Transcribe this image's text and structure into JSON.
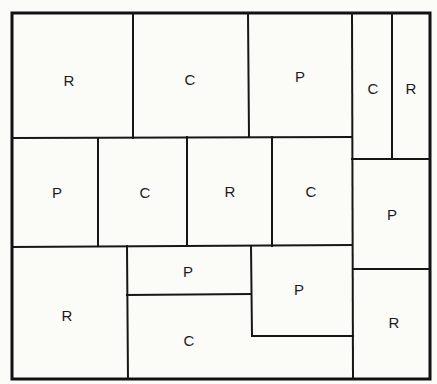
{
  "diagram": {
    "type": "floor-plan-partition",
    "legend_codes": [
      "R",
      "C",
      "P"
    ],
    "regions": [
      {
        "id": "r1",
        "label": "R",
        "row": 1,
        "position": "top-left"
      },
      {
        "id": "r2",
        "label": "C",
        "row": 1,
        "position": "top-center-left"
      },
      {
        "id": "r3",
        "label": "P",
        "row": 1,
        "position": "top-center-right"
      },
      {
        "id": "r4",
        "label": "C",
        "row": 1,
        "position": "top-right-narrow-left"
      },
      {
        "id": "r5",
        "label": "R",
        "row": 1,
        "position": "top-right-narrow-right"
      },
      {
        "id": "r6",
        "label": "P",
        "row": 2,
        "position": "middle-1"
      },
      {
        "id": "r7",
        "label": "C",
        "row": 2,
        "position": "middle-2"
      },
      {
        "id": "r8",
        "label": "R",
        "row": 2,
        "position": "middle-3"
      },
      {
        "id": "r9",
        "label": "C",
        "row": 2,
        "position": "middle-4"
      },
      {
        "id": "r10",
        "label": "P",
        "row": 2,
        "position": "right-column"
      },
      {
        "id": "r11",
        "label": "R",
        "row": 3,
        "position": "bottom-left"
      },
      {
        "id": "r12",
        "label": "P",
        "row": 3,
        "position": "bottom-center-top"
      },
      {
        "id": "r13",
        "label": "C",
        "row": 3,
        "position": "bottom-center-l-shape"
      },
      {
        "id": "r14",
        "label": "P",
        "row": 3,
        "position": "bottom-center-right"
      },
      {
        "id": "r15",
        "label": "R",
        "row": 3,
        "position": "bottom-right"
      }
    ]
  }
}
